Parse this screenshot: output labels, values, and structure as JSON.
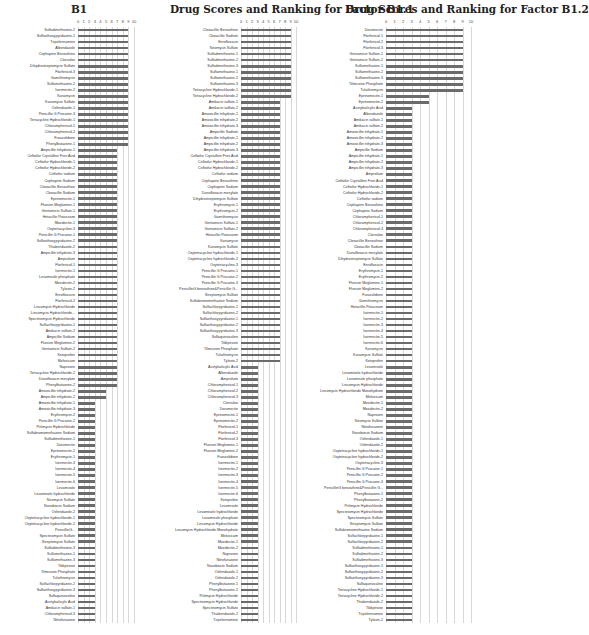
{
  "chart_data": [
    {
      "type": "bar",
      "orientation": "horizontal",
      "title": "B1",
      "xlim": [
        0,
        10
      ],
      "xticks": [
        "0",
        "1",
        "2",
        "3",
        "4",
        "5",
        "6",
        "7",
        "8",
        "9",
        "10"
      ],
      "grid": true,
      "categories": [
        "Sulfadimethoxine-2",
        "Sulfaethoxypyridazine-1",
        "Tripelennamine",
        "Albendazole",
        "Cephapirin Benzathine",
        "Clorsulon",
        "Dihydrostreptomycin Sulfate",
        "Florfenicol-3",
        "Gamithromycin",
        "Sulfamethazine-2",
        "Ivermectin-2",
        "Kanamycin",
        "Kanamycin Sulfate",
        "Oxfendazole-1",
        "Penicillin G Procaine-3",
        "Tetracycline Hydrochloride-1",
        "Chloramphenicol-1",
        "Chloramphenicol-2",
        "Furazolidone",
        "Phenylbutazone-1",
        "Ampicillin trihydrate-1",
        "Ceftiofur Crystalline Free Acid",
        "Ceftiofur Hydrochloride-1",
        "Ceftiofur Hydrochloride-2",
        "Ceftiofur sodium",
        "Cephapirin Sodium",
        "Cloxacillin Benzathine",
        "Cloxacillin Sodium",
        "Eprinomectin-1",
        "Flunixin Meglumine-1",
        "Gentamicin Sulfate-1",
        "Hetacillin Potassium",
        "Moxidectin-1",
        "Oxytetracycline-3",
        "Penicillin G Procaine-1",
        "Sulfaethoxypyridazine-2",
        "Thiabendazole-2",
        "Ampicillin trihydrate-3",
        "Amprolium",
        "Florfenicol-1",
        "Ivermectin-1",
        "Levamisole phosphate",
        "Moxidectin-2",
        "Tylosin-2",
        "Enrofloxacin",
        "Florfenicol-2",
        "Lincomycin Hydrochloride",
        "Lincomycin Hydrochloride...",
        "Spectinomycin Hydrochloride",
        "Sulfachlorpyridazine-1",
        "Amikacin sulfate-2",
        "Ampicillin Sodium",
        "Flunixin Meglumine-2",
        "Gentamicin Sulfate-2",
        "Ketoprofen",
        "Meloxicam",
        "Naproxen",
        "Tetracycline Hydrochloride-2",
        "Danofloxacin mesylate",
        "Phenylbutazone-2",
        "Amoxicillin trihydrate-2",
        "Ampicillin trihydrate-2",
        "Amoxicillin trihydrate-1",
        "Amoxicillin trihydrate-3",
        "Erythromycin-2",
        "Penicillin G Procaine-2",
        "Pirlimycin Hydrochloride",
        "Sulfabromomethazine Sodium",
        "Sulfadimethoxine-1",
        "Doramectin",
        "Eprinomectin-2",
        "Erythromycin-1",
        "Ivermectin-3",
        "Ivermectin-4",
        "Ivermectin-5",
        "Ivermectin-6",
        "Levamisole",
        "Levamisole hydrochloride",
        "Neomycin Sulfate",
        "Novobiocin Sodium",
        "Oxfendazole-2",
        "Oxytetracycline hydrochloride-1",
        "Oxytetracycline hydrochloride-2",
        "PenicillinG...",
        "Spectinomycin Sulfate",
        "Streptomycin Sulfate",
        "Sulfadimethoxine-3",
        "Sulfamethazine-1",
        "Sulfamethazine-3",
        "Tildipirosin",
        "Tilmicosin Phosphate",
        "Tulathromycin",
        "Sulfachlorpyridazine-2",
        "Sulfaethoxypyridazine-3",
        "Sulfaquinoxaline",
        "Acetylsalicylic Acid",
        "Amikacin sulfate-1",
        "Chloramphenicol-3",
        "Nitrofurazone"
      ],
      "values": [
        9,
        9,
        9,
        9,
        9,
        9,
        9,
        9,
        9,
        9,
        9,
        9,
        9,
        9,
        9,
        9,
        9,
        9,
        9,
        9,
        7,
        7,
        7,
        7,
        7,
        7,
        7,
        7,
        7,
        7,
        7,
        7,
        7,
        7,
        7,
        7,
        7,
        7,
        7,
        7,
        7,
        7,
        7,
        7,
        7,
        7,
        7,
        7,
        7,
        7,
        7,
        7,
        7,
        7,
        7,
        7,
        7,
        7,
        7,
        7,
        5,
        5,
        3,
        3,
        3,
        3,
        3,
        3,
        3,
        3,
        3,
        3,
        3,
        3,
        3,
        3,
        3,
        3,
        3,
        3,
        3,
        3,
        3,
        3,
        3,
        3,
        3,
        3,
        3,
        3,
        3,
        3,
        3,
        3,
        3,
        3,
        3,
        3,
        3
      ]
    },
    {
      "type": "bar",
      "orientation": "horizontal",
      "title": "Drug Scores and Ranking for Factor B1.1",
      "xlim": [
        0,
        10
      ],
      "xticks": [
        "0",
        "1",
        "2",
        "3",
        "4",
        "5",
        "6",
        "7",
        "8",
        "9",
        "10"
      ],
      "grid": true,
      "categories": [
        "Cloxacillin Benzathine",
        "Cloxacillin Sodium",
        "Enrofloxacin",
        "Neomycin Sulfate",
        "Sulfadimethoxine-1",
        "Sulfadimethoxine-2",
        "Sulfadimethoxine-3",
        "Sulfamethazine-1",
        "Sulfamethazine-2",
        "Sulfamethazine-3",
        "Tetracycline Hydrochloride-1",
        "Tetracycline Hydrochloride-2",
        "Amikacin sulfate-1",
        "Amikacin sulfate-2",
        "Amoxicillin trihydrate-1",
        "Amoxicillin trihydrate-2",
        "Amoxicillin trihydrate-3",
        "Ampicillin Sodium",
        "Ampicillin trihydrate-1",
        "Ampicillin trihydrate-2",
        "Ampicillin trihydrate-3",
        "Ceftiofur Crystalline Free Acid",
        "Ceftiofur Hydrochloride-1",
        "Ceftiofur Hydrochloride-2",
        "Ceftiofur sodium",
        "Cephapirin Benzathine",
        "Cephapirin Sodium",
        "Danofloxacin mesylate",
        "Dihydrostreptomycin Sulfate",
        "Erythromycin-1",
        "Erythromycin-2",
        "Gamithromycin",
        "Gentamicin Sulfate-1",
        "Gentamicin Sulfate-2",
        "Hetacillin Potassium",
        "Kanamycin",
        "Kanamycin Sulfate",
        "Oxytetracycline hydrochloride-1",
        "Oxytetracycline hydrochloride-2",
        "Oxytetracycline-3",
        "Penicillin G Procaine-1",
        "Penicillin G Procaine-2",
        "Penicillin G Procaine-3",
        "PenicillinG benzathine&Penicillin G...",
        "Streptomycin Sulfate",
        "Sulfabromomethazine Sodium",
        "Sulfachlorpyridazine-1",
        "Sulfachlorpyridazine-2",
        "Sulfaethoxypyridazine-1",
        "Sulfaethoxypyridazine-2",
        "Sulfaethoxypyridazine-3",
        "Sulfaquinoxaline",
        "Tildipirosin",
        "Tilmicosin Phosphate",
        "Tulathromycin",
        "Tylosin-2",
        "Acetylsalicylic Acid",
        "Albendazole",
        "Amprolium",
        "Chloramphenicol-1",
        "Chloramphenicol-2",
        "Chloramphenicol-3",
        "Clorsulon",
        "Doramectin",
        "Eprinomectin-1",
        "Eprinomectin-2",
        "Florfenicol-1",
        "Florfenicol-2",
        "Florfenicol-3",
        "Flunixin Meglumine-1",
        "Flunixin Meglumine-2",
        "Furazolidone",
        "Ivermectin-1",
        "Ivermectin-2",
        "Ivermectin-3",
        "Ivermectin-4",
        "Ivermectin-5",
        "Ivermectin-6",
        "Ketoprofen",
        "Levamisole",
        "Levamisole hydrochloride",
        "Levamisole phosphate",
        "Lincomycin Hydrochloride",
        "Lincomycin Hydrochloride Monohydrate",
        "Meloxicam",
        "Moxidectin-1",
        "Moxidectin-2",
        "Naproxen",
        "Nitrofurazone",
        "Novobiocin Sodium",
        "Oxfendazole-1",
        "Oxfendazole-2",
        "Phenylbutazone-1",
        "Phenylbutazone-2",
        "Pirlimycin Hydrochloride",
        "Spectinomycin Hydrochloride",
        "Spectinomycin Sulfate",
        "Thiabendazole-2",
        "Tripelennamine"
      ],
      "values": [
        9,
        9,
        9,
        9,
        9,
        9,
        9,
        9,
        9,
        9,
        9,
        9,
        7,
        7,
        7,
        7,
        7,
        7,
        7,
        7,
        7,
        7,
        7,
        7,
        7,
        7,
        7,
        7,
        7,
        7,
        7,
        7,
        7,
        7,
        7,
        7,
        7,
        7,
        7,
        7,
        7,
        7,
        7,
        7,
        7,
        7,
        7,
        7,
        7,
        7,
        7,
        7,
        7,
        7,
        7,
        7,
        3,
        3,
        3,
        3,
        3,
        3,
        3,
        3,
        3,
        3,
        3,
        3,
        3,
        3,
        3,
        3,
        3,
        3,
        3,
        3,
        3,
        3,
        3,
        3,
        3,
        3,
        3,
        3,
        3,
        3,
        3,
        3,
        3,
        3,
        3,
        3,
        3,
        3,
        3,
        3,
        3,
        3,
        3
      ]
    },
    {
      "type": "bar",
      "orientation": "horizontal",
      "title": "Drug Scores and Ranking for Factor B1.2",
      "xlim": [
        0,
        10
      ],
      "xticks": [
        "0",
        "1",
        "2",
        "3",
        "4",
        "5",
        "6",
        "7",
        "8",
        "9",
        "10"
      ],
      "grid": true,
      "categories": [
        "Doramectin",
        "Florfenicol-1",
        "Florfenicol-2",
        "Florfenicol-3",
        "Gentamicin Sulfate-1",
        "Gentamicin Sulfate-2",
        "Sulfamethazine-1",
        "Sulfamethazine-2",
        "Sulfamethazine-3",
        "Tilmicosin Phosphate",
        "Tulathromycin",
        "Eprinomectin-1",
        "Eprinomectin-2",
        "Acetylsalicylic Acid",
        "Albendazole",
        "Amikacin sulfate-1",
        "Amikacin sulfate-2",
        "Amoxicillin trihydrate-1",
        "Amoxicillin trihydrate-2",
        "Amoxicillin trihydrate-3",
        "Ampicillin Sodium",
        "Ampicillin trihydrate-1",
        "Ampicillin trihydrate-2",
        "Ampicillin trihydrate-3",
        "Amprolium",
        "Ceftiofur Crystalline Free Acid",
        "Ceftiofur Hydrochloride-1",
        "Ceftiofur Hydrochloride-2",
        "Ceftiofur sodium",
        "Cephapirin Benzathine",
        "Cephapirin Sodium",
        "Chloramphenicol-1",
        "Chloramphenicol-2",
        "Chloramphenicol-3",
        "Clorsulon",
        "Cloxacillin Benzathine",
        "Cloxacillin Sodium",
        "Danofloxacin mesylate",
        "Dihydrostreptomycin Sulfate",
        "Enrofloxacin",
        "Erythromycin-1",
        "Erythromycin-2",
        "Flunixin Meglumine-1",
        "Flunixin Meglumine-2",
        "Furazolidone",
        "Gamithromycin",
        "Hetacillin Potassium",
        "Ivermectin-1",
        "Ivermectin-2",
        "Ivermectin-3",
        "Ivermectin-4",
        "Ivermectin-5",
        "Ivermectin-6",
        "Kanamycin",
        "Kanamycin Sulfate",
        "Ketoprofen",
        "Levamisole",
        "Levamisole hydrochloride",
        "Levamisole phosphate",
        "Lincomycin Hydrochloride",
        "Lincomycin Hydrochloride Monohydrate",
        "Meloxicam",
        "Moxidectin-1",
        "Moxidectin-2",
        "Naproxen",
        "Neomycin Sulfate",
        "Nitrofurazone",
        "Novobiocin Sodium",
        "Oxfendazole-1",
        "Oxfendazole-2",
        "Oxytetracycline hydrochloride-1",
        "Oxytetracycline hydrochloride-2",
        "Oxytetracycline-3",
        "Penicillin G Procaine-1",
        "Penicillin G Procaine-2",
        "Penicillin G Procaine-3",
        "PenicillinG benzathine&Penicillin G...",
        "Phenylbutazone-1",
        "Phenylbutazone-2",
        "Pirlimycin Hydrochloride",
        "Spectinomycin Hydrochloride",
        "Spectinomycin Sulfate",
        "Streptomycin Sulfate",
        "Sulfabromomethazine Sodium",
        "Sulfachlorpyridazine-1",
        "Sulfachlorpyridazine-2",
        "Sulfadimethoxine-1",
        "Sulfadimethoxine-2",
        "Sulfadimethoxine-3",
        "Sulfaethoxypyridazine-1",
        "Sulfaethoxypyridazine-2",
        "Sulfaethoxypyridazine-3",
        "Sulfaquinoxaline",
        "Tetracycline Hydrochloride-1",
        "Tetracycline Hydrochloride-2",
        "Thiabendazole-2",
        "Tildipirosin",
        "Tripelennamine",
        "Tylosin-2"
      ],
      "values": [
        9,
        9,
        9,
        9,
        9,
        9,
        9,
        9,
        9,
        9,
        9,
        5,
        5,
        3,
        3,
        3,
        3,
        3,
        3,
        3,
        3,
        3,
        3,
        3,
        3,
        3,
        3,
        3,
        3,
        3,
        3,
        3,
        3,
        3,
        3,
        3,
        3,
        3,
        3,
        3,
        3,
        3,
        3,
        3,
        3,
        3,
        3,
        3,
        3,
        3,
        3,
        3,
        3,
        3,
        3,
        3,
        3,
        3,
        3,
        3,
        3,
        3,
        3,
        3,
        3,
        3,
        3,
        3,
        3,
        3,
        3,
        3,
        3,
        3,
        3,
        3,
        3,
        3,
        3,
        3,
        3,
        3,
        3,
        3,
        3,
        3,
        3,
        3,
        3,
        3,
        3,
        3,
        3,
        3,
        3,
        3,
        3,
        3,
        3
      ]
    }
  ],
  "style": {
    "bar_color": "#6b6b6b",
    "grid_color": "#d8d8d8"
  }
}
